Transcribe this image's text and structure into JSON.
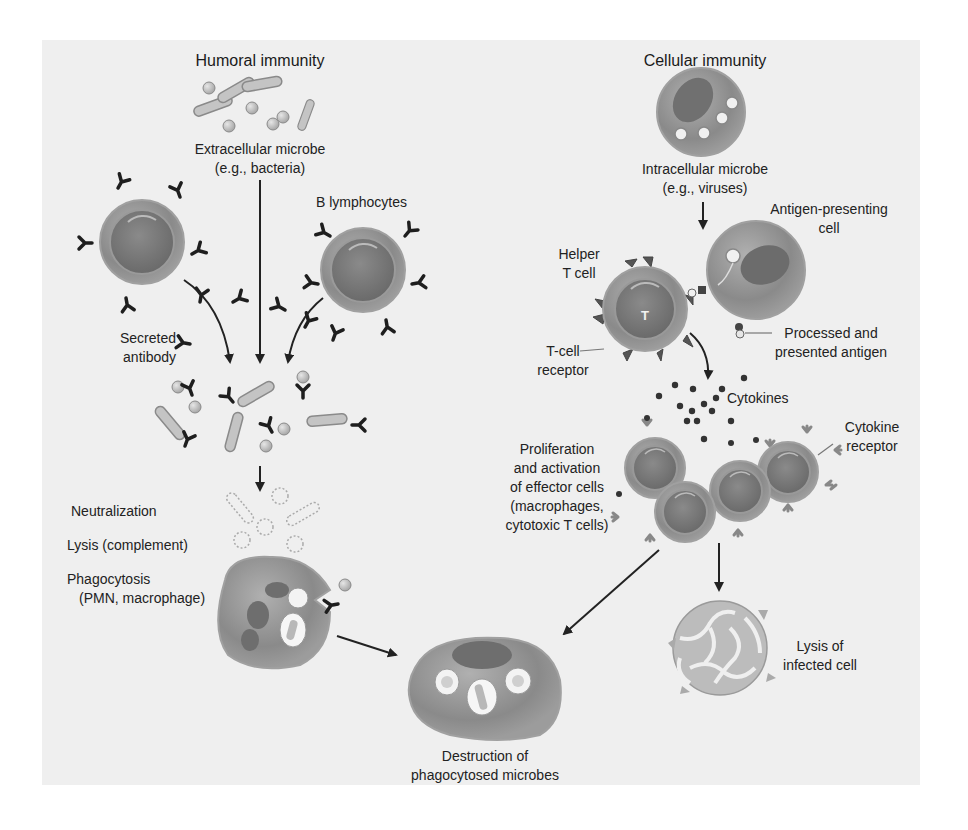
{
  "colors": {
    "panel_background": "#efefef",
    "page_background": "#ffffff",
    "cell_fill": "#8e8e8e",
    "nucleus_fill": "#6e6e6e",
    "arrow": "#222222",
    "text": "#222222"
  },
  "humoral": {
    "title": "Humoral immunity",
    "microbe_label_line1": "Extracellular microbe",
    "microbe_label_line2": "(e.g., bacteria)",
    "b_lymphocytes_label": "B lymphocytes",
    "secreted_antibody_line1": "Secreted",
    "secreted_antibody_line2": "antibody",
    "outcomes": {
      "neutralization": "Neutralization",
      "lysis": "Lysis (complement)",
      "phagocytosis_line1": "Phagocytosis",
      "phagocytosis_line2": "(PMN, macrophage)"
    }
  },
  "cellular": {
    "title": "Cellular immunity",
    "microbe_label_line1": "Intracellular microbe",
    "microbe_label_line2": "(e.g., viruses)",
    "apc_label_line1": "Antigen-presenting",
    "apc_label_line2": "cell",
    "helper_label_line1": "Helper",
    "helper_label_line2": "T cell",
    "helper_cell_letter": "T",
    "tcr_label_line1": "T-cell",
    "tcr_label_line2": "receptor",
    "antigen_label_line1": "Processed and",
    "antigen_label_line2": "presented antigen",
    "cytokines_label": "Cytokines",
    "cytokine_receptor_line1": "Cytokine",
    "cytokine_receptor_line2": "receptor",
    "effector_label_lines": [
      "Proliferation",
      "and activation",
      "of effector cells",
      "(macrophages,",
      "cytotoxic T cells)"
    ],
    "lysis_label_line1": "Lysis of",
    "lysis_label_line2": "infected cell"
  },
  "shared": {
    "destruction_line1": "Destruction of",
    "destruction_line2": "phagocytosed microbes"
  }
}
